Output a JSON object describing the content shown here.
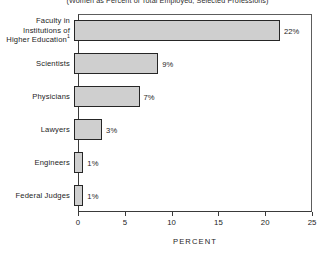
{
  "chart_data": {
    "type": "bar",
    "orientation": "horizontal",
    "title": "(Women as Percent of Total Employed, Selected Professions)",
    "xlabel": "PERCENT",
    "ylabel": "",
    "xlim": [
      0,
      25
    ],
    "xticks": [
      0,
      5,
      10,
      15,
      20,
      25
    ],
    "xtick_labels": [
      "0",
      "5",
      "10",
      "15",
      "20",
      "25"
    ],
    "grid": false,
    "legend": null,
    "categories": [
      "Faculty in Institutions of Higher Education",
      "Scientists",
      "Physicians",
      "Lawyers",
      "Engineers",
      "Federal Judges"
    ],
    "values": [
      22,
      9,
      7,
      3,
      1,
      1
    ],
    "data_labels": [
      "22%",
      "9%",
      "7%",
      "3%",
      "1%",
      "1%"
    ],
    "bar_fill_color": "#cfcfcf",
    "bar_edge_color": "#262626",
    "background_color": "#ffffff"
  },
  "rows": [
    {
      "label_line1": "Faculty in",
      "label_line2": "Institutions of",
      "label_line3": "Higher Education",
      "footnote_marker": "1",
      "value": 22,
      "value_label": "22%"
    },
    {
      "label_line1": "Scientists",
      "label_line2": "",
      "label_line3": "",
      "footnote_marker": "",
      "value": 9,
      "value_label": "9%"
    },
    {
      "label_line1": "Physicians",
      "label_line2": "",
      "label_line3": "",
      "footnote_marker": "",
      "value": 7,
      "value_label": "7%"
    },
    {
      "label_line1": "Lawyers",
      "label_line2": "",
      "label_line3": "",
      "footnote_marker": "",
      "value": 3,
      "value_label": "3%"
    },
    {
      "label_line1": "Engineers",
      "label_line2": "",
      "label_line3": "",
      "footnote_marker": "",
      "value": 1,
      "value_label": "1%"
    },
    {
      "label_line1": "Federal Judges",
      "label_line2": "",
      "label_line3": "",
      "footnote_marker": "",
      "value": 1,
      "value_label": "1%"
    }
  ],
  "axis": {
    "title": "PERCENT",
    "ticks": [
      {
        "value": 0,
        "label": "0"
      },
      {
        "value": 5,
        "label": "5"
      },
      {
        "value": 10,
        "label": "10"
      },
      {
        "value": 15,
        "label": "15"
      },
      {
        "value": 20,
        "label": "20"
      },
      {
        "value": 25,
        "label": "25"
      }
    ]
  }
}
